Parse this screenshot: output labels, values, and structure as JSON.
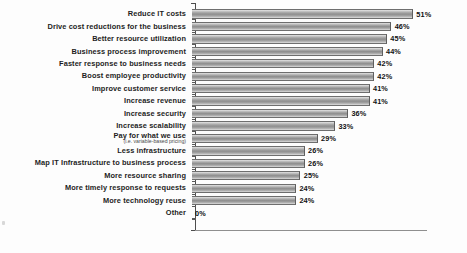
{
  "chart_data": {
    "type": "bar",
    "orientation": "horizontal",
    "title": "",
    "subtitle": "",
    "xlabel": "",
    "ylabel": "",
    "xlim": [
      0,
      55
    ],
    "grid": false,
    "legend": null,
    "value_suffix": "%",
    "categories": [
      "Reduce IT costs",
      "Drive cost reductions for the business",
      "Better resource utilization",
      "Business process improvement",
      "Faster response to business needs",
      "Boost employee productivity",
      "Improve customer service",
      "Increase revenue",
      "Increase security",
      "Increase scalability",
      "Pay for what we use",
      "Less infrastructure",
      "Map IT Infrastructure to business process",
      "More resource sharing",
      "More timely response to requests",
      "More technology reuse",
      "Other"
    ],
    "category_sublabels": {
      "Pay for what we use": "(i.e. variable-based pricing)"
    },
    "values": [
      51,
      46,
      45,
      44,
      42,
      42,
      41,
      41,
      36,
      33,
      29,
      26,
      26,
      25,
      24,
      24,
      0
    ],
    "data_labels": [
      "51%",
      "46%",
      "45%",
      "44%",
      "42%",
      "42%",
      "41%",
      "41%",
      "36%",
      "33%",
      "29%",
      "26%",
      "26%",
      "25%",
      "24%",
      "24%",
      "0%"
    ],
    "colors": {
      "bar_fill_light": "#e8e8e8",
      "bar_fill_mid": "#a8a8a8",
      "bar_fill_dark": "#8e8e8e",
      "bar_outline": "#6e6e6e",
      "axis": "#4d4d4d",
      "text": "#1d1d1d",
      "background": "#fdfdfd"
    }
  },
  "rows": [
    {
      "label": "Reduce IT costs",
      "sub": "",
      "value": 51,
      "value_label": "51%"
    },
    {
      "label": "Drive cost reductions for the business",
      "sub": "",
      "value": 46,
      "value_label": "46%"
    },
    {
      "label": "Better resource utilization",
      "sub": "",
      "value": 45,
      "value_label": "45%"
    },
    {
      "label": "Business process improvement",
      "sub": "",
      "value": 44,
      "value_label": "44%"
    },
    {
      "label": "Faster response to business needs",
      "sub": "",
      "value": 42,
      "value_label": "42%"
    },
    {
      "label": "Boost employee productivity",
      "sub": "",
      "value": 42,
      "value_label": "42%"
    },
    {
      "label": "Improve customer service",
      "sub": "",
      "value": 41,
      "value_label": "41%"
    },
    {
      "label": "Increase revenue",
      "sub": "",
      "value": 41,
      "value_label": "41%"
    },
    {
      "label": "Increase security",
      "sub": "",
      "value": 36,
      "value_label": "36%"
    },
    {
      "label": "Increase scalability",
      "sub": "",
      "value": 33,
      "value_label": "33%"
    },
    {
      "label": "Pay for what we use",
      "sub": "(i.e. variable-based pricing)",
      "value": 29,
      "value_label": "29%"
    },
    {
      "label": "Less infrastructure",
      "sub": "",
      "value": 26,
      "value_label": "26%"
    },
    {
      "label": "Map IT Infrastructure to business process",
      "sub": "",
      "value": 26,
      "value_label": "26%"
    },
    {
      "label": "More resource sharing",
      "sub": "",
      "value": 25,
      "value_label": "25%"
    },
    {
      "label": "More timely response to requests",
      "sub": "",
      "value": 24,
      "value_label": "24%"
    },
    {
      "label": "More technology reuse",
      "sub": "",
      "value": 24,
      "value_label": "24%"
    },
    {
      "label": "Other",
      "sub": "",
      "value": 0,
      "value_label": "0%"
    }
  ]
}
